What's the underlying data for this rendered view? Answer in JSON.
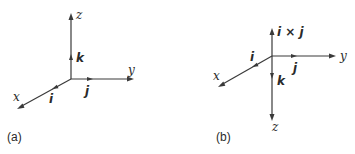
{
  "figure": {
    "panel_a": {
      "caption": "(a)",
      "axes": {
        "x": "x",
        "y": "y",
        "z": "z"
      },
      "unit_vectors": {
        "i": "i",
        "j": "j",
        "k": "k"
      }
    },
    "panel_b": {
      "caption": "(b)",
      "axes": {
        "x": "x",
        "y": "y",
        "z": "z"
      },
      "unit_vectors": {
        "i": "i",
        "j": "j",
        "k": "k",
        "cross": "i × j"
      }
    }
  }
}
